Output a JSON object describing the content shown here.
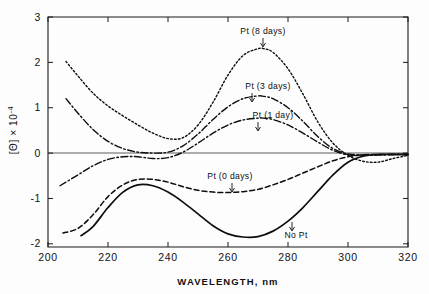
{
  "chart_data": {
    "type": "line",
    "title": "",
    "xlabel": "WAVELENGTH,  nm",
    "ylabel": "[Θ]  × 10⁻⁴",
    "xlim": [
      200,
      320
    ],
    "ylim": [
      -2.07,
      3
    ],
    "xticks": [
      200,
      220,
      240,
      260,
      280,
      300,
      320
    ],
    "xtick_labels": [
      "200",
      "220",
      "240",
      "260",
      "280",
      "300",
      "320"
    ],
    "yticks": [
      -2,
      -1,
      0,
      1,
      2,
      3
    ],
    "ytick_labels": [
      "-2",
      "-1",
      "0",
      "1",
      "2",
      "3"
    ],
    "grid": false,
    "legend": "inline-annotations",
    "zero_line": true,
    "series": [
      {
        "name": "Pt (8 days)",
        "style": "dotted",
        "label": "Pt  (8 days)",
        "x": [
          206,
          210,
          215,
          220,
          225,
          230,
          235,
          240,
          245,
          250,
          255,
          260,
          265,
          270,
          272,
          275,
          280,
          285,
          290,
          295,
          300,
          305,
          310,
          315,
          320
        ],
        "y": [
          2.02,
          1.7,
          1.32,
          1.04,
          0.82,
          0.62,
          0.44,
          0.32,
          0.34,
          0.62,
          1.12,
          1.72,
          2.15,
          2.3,
          2.3,
          2.22,
          1.86,
          1.3,
          0.68,
          0.22,
          -0.05,
          -0.18,
          -0.2,
          -0.12,
          -0.05
        ]
      },
      {
        "name": "Pt (3 days)",
        "style": "dash-dot",
        "label": "Pt  (3 days)",
        "x": [
          206,
          210,
          215,
          220,
          225,
          230,
          235,
          240,
          245,
          250,
          255,
          260,
          265,
          270,
          272,
          275,
          280,
          285,
          290,
          295,
          300,
          305,
          310,
          315,
          320
        ],
        "y": [
          1.2,
          0.88,
          0.52,
          0.26,
          0.1,
          0.02,
          0.0,
          0.02,
          0.16,
          0.42,
          0.74,
          1.02,
          1.2,
          1.26,
          1.25,
          1.2,
          1.0,
          0.7,
          0.36,
          0.1,
          -0.02,
          -0.04,
          -0.04,
          -0.03,
          -0.03
        ]
      },
      {
        "name": "Pt (1 day)",
        "style": "dash-dot",
        "label": "Pt  (1 day)",
        "x": [
          204,
          210,
          215,
          220,
          225,
          230,
          235,
          240,
          245,
          250,
          255,
          260,
          265,
          270,
          272,
          275,
          280,
          285,
          290,
          295,
          300,
          305,
          310,
          315,
          320
        ],
        "y": [
          -0.72,
          -0.48,
          -0.28,
          -0.14,
          -0.08,
          -0.08,
          -0.12,
          -0.1,
          0.02,
          0.22,
          0.44,
          0.62,
          0.73,
          0.77,
          0.77,
          0.74,
          0.62,
          0.44,
          0.24,
          0.06,
          -0.04,
          -0.05,
          -0.04,
          -0.03,
          -0.03
        ]
      },
      {
        "name": "Pt (0 days)",
        "style": "dashed",
        "label": "Pt (0 days)",
        "x": [
          205,
          210,
          215,
          220,
          225,
          230,
          235,
          240,
          245,
          250,
          255,
          260,
          265,
          270,
          275,
          280,
          285,
          290,
          295,
          300,
          305,
          310,
          315,
          320
        ],
        "y": [
          -1.76,
          -1.66,
          -1.36,
          -0.96,
          -0.7,
          -0.58,
          -0.58,
          -0.64,
          -0.74,
          -0.82,
          -0.86,
          -0.87,
          -0.85,
          -0.8,
          -0.7,
          -0.58,
          -0.44,
          -0.3,
          -0.17,
          -0.08,
          -0.04,
          -0.03,
          -0.03,
          -0.03
        ]
      },
      {
        "name": "No Pt",
        "style": "solid",
        "label": "No Pt",
        "x": [
          211,
          215,
          220,
          225,
          230,
          235,
          240,
          245,
          250,
          255,
          260,
          265,
          270,
          275,
          280,
          285,
          290,
          295,
          300,
          305,
          310,
          315,
          320
        ],
        "y": [
          -1.82,
          -1.62,
          -1.2,
          -0.86,
          -0.7,
          -0.72,
          -0.86,
          -1.08,
          -1.34,
          -1.6,
          -1.78,
          -1.85,
          -1.84,
          -1.72,
          -1.5,
          -1.2,
          -0.84,
          -0.48,
          -0.2,
          -0.07,
          -0.03,
          -0.03,
          -0.03
        ]
      }
    ],
    "annotations": [
      {
        "text": "Pt  (8 days)",
        "series": "Pt (8 days)"
      },
      {
        "text": "Pt  (3 days)",
        "series": "Pt (3 days)"
      },
      {
        "text": "Pt  (1 day)",
        "series": "Pt (1 day)"
      },
      {
        "text": "Pt (0 days)",
        "series": "Pt (0 days)"
      },
      {
        "text": "No Pt",
        "series": "No Pt"
      }
    ]
  },
  "labels": {
    "x_axis_title": "WAVELENGTH,  nm",
    "y_axis_title": "[Θ]  × 10",
    "y_axis_exponent": "-4",
    "ann_8days": "Pt  (8 days)",
    "ann_3days": "Pt  (3 days)",
    "ann_1day": "Pt  (1 day)",
    "ann_0days": "Pt (0 days)",
    "ann_nopt": "No Pt"
  }
}
